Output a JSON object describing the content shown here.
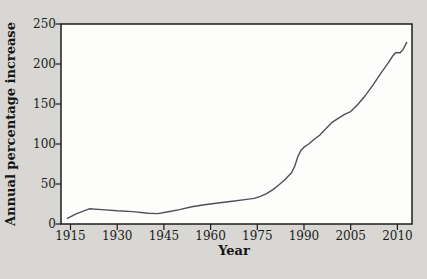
{
  "figure": {
    "background_color": "#d8d7d3",
    "plot_background_color": "#fdfdfb",
    "axis_color": "#1c1c1c",
    "line_color": "#50505a"
  },
  "chart_data": {
    "type": "line",
    "title": "",
    "xlabel": "Year",
    "ylabel": "Annual percentage increase",
    "xticks": [
      "1915",
      "1930",
      "1945",
      "1960",
      "1975",
      "1990",
      "2005",
      "2010"
    ],
    "yticks": [
      "0",
      "50",
      "100",
      "150",
      "200",
      "250"
    ],
    "ylim": [
      0,
      250
    ],
    "grid": false,
    "legend": false,
    "points": [
      [
        1914,
        7
      ],
      [
        1917,
        13
      ],
      [
        1921,
        19
      ],
      [
        1925,
        18
      ],
      [
        1930,
        16.5
      ],
      [
        1935,
        15.5
      ],
      [
        1940,
        13.5
      ],
      [
        1943,
        13
      ],
      [
        1946,
        15
      ],
      [
        1950,
        18
      ],
      [
        1954,
        21.5
      ],
      [
        1958,
        24
      ],
      [
        1963,
        26.5
      ],
      [
        1967,
        28.5
      ],
      [
        1971,
        30.5
      ],
      [
        1974,
        32
      ],
      [
        1976,
        34.5
      ],
      [
        1978,
        38
      ],
      [
        1980,
        43
      ],
      [
        1982,
        49
      ],
      [
        1984,
        56
      ],
      [
        1986,
        64
      ],
      [
        1987,
        72
      ],
      [
        1988,
        84
      ],
      [
        1989,
        92
      ],
      [
        1990,
        96
      ],
      [
        1991.5,
        100
      ],
      [
        1993,
        105
      ],
      [
        1995,
        111
      ],
      [
        1997,
        119
      ],
      [
        1999,
        127
      ],
      [
        2001,
        132
      ],
      [
        2003,
        137
      ],
      [
        2005,
        140.5
      ],
      [
        2005.8,
        150
      ],
      [
        2006.6,
        161
      ],
      [
        2007.4,
        174
      ],
      [
        2008.2,
        188
      ],
      [
        2009,
        201
      ],
      [
        2009.5,
        210
      ],
      [
        2009.8,
        214
      ],
      [
        2010.3,
        214
      ],
      [
        2010.6,
        218
      ],
      [
        2011,
        227
      ]
    ]
  }
}
